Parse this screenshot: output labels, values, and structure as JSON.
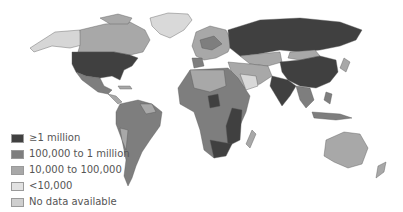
{
  "colors": {
    "c1": "#404040",
    "c2": "#7e7e7e",
    "c3": "#a8a8a8",
    "c4": "#d4d4d4",
    "c5": "#c6c6c6",
    "border": "#555555",
    "ocean": "#ffffff"
  },
  "legend": {
    "items": [
      {
        "label": "≥1 million",
        "color": "#404040"
      },
      {
        "label": "100,000 to 1 million",
        "color": "#7e7e7e"
      },
      {
        "label": "10,000 to 100,000",
        "color": "#a8a8a8"
      },
      {
        "label": "<10,000",
        "color": "#e2e2e2"
      },
      {
        "label": "No data available",
        "color": "#cfcfcf"
      }
    ]
  }
}
